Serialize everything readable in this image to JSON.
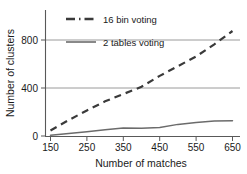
{
  "chart_data": {
    "type": "line",
    "title": "",
    "xlabel": "Number of matches",
    "ylabel": "Number of clusters",
    "xlim": [
      150,
      650
    ],
    "ylim": [
      0,
      900
    ],
    "xticks": [
      150,
      250,
      350,
      450,
      550,
      650
    ],
    "yticks": [
      0,
      400,
      800
    ],
    "grid": "horizontal gridlines at y = 400 and y = 800",
    "legend_position": "top-left inside plot",
    "series": [
      {
        "name": "16 bin voting",
        "style": "dashed",
        "color": "#3a3a3a",
        "x": [
          150,
          200,
          250,
          300,
          350,
          400,
          450,
          500,
          550,
          600,
          650
        ],
        "values": [
          50,
          135,
          215,
          290,
          350,
          410,
          500,
          580,
          660,
          760,
          870
        ]
      },
      {
        "name": "2 tables voting",
        "style": "solid",
        "color": "#6b6b6b",
        "x": [
          150,
          200,
          250,
          300,
          350,
          400,
          450,
          500,
          550,
          600,
          650
        ],
        "values": [
          10,
          25,
          40,
          55,
          70,
          68,
          75,
          100,
          115,
          128,
          130
        ]
      }
    ]
  },
  "axes": {
    "y_title": "Number of clusters",
    "x_title": "Number of matches",
    "y_tick_labels": [
      "800",
      "400",
      "0"
    ],
    "x_tick_labels": [
      "150",
      "250",
      "350",
      "450",
      "550",
      "650"
    ]
  },
  "legend": {
    "entries": [
      {
        "label": "16 bin voting",
        "swatch": "dashed-line-swatch"
      },
      {
        "label": "2 tables voting",
        "swatch": "solid-line-swatch"
      }
    ]
  }
}
